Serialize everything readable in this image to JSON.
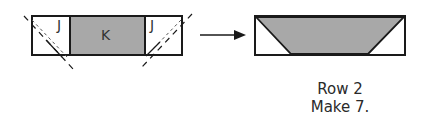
{
  "diagram": {
    "left_unit": {
      "pieces": [
        {
          "label": "J",
          "fill": "#ffffff"
        },
        {
          "label": "K",
          "fill": "#a8a8a8"
        },
        {
          "label": "J",
          "fill": "#ffffff"
        }
      ]
    },
    "arrow": "right-arrow",
    "result_unit": {
      "shape": "flying-geese-trapezoid",
      "fill": "#a8a8a8"
    },
    "caption": {
      "line1": "Row 2",
      "line2": "Make 7."
    },
    "colors": {
      "stroke": "#1a1a1a",
      "gray_fill": "#a8a8a8",
      "background": "#ffffff"
    }
  }
}
